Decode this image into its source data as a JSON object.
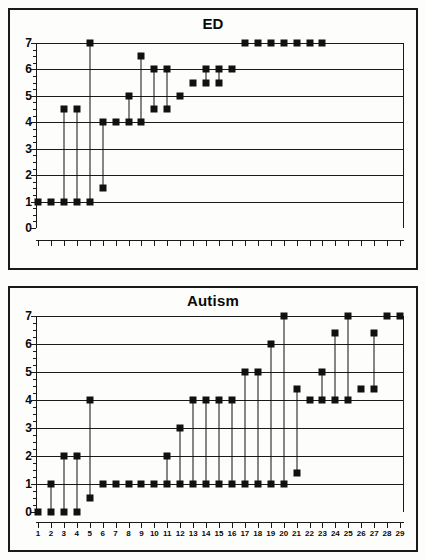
{
  "figure": {
    "panels": [
      {
        "id": "ed",
        "title": "ED"
      },
      {
        "id": "autism",
        "title": "Autism"
      }
    ],
    "marker_color": "#111111",
    "axis_color": "#1a1a1a",
    "background": "#fdfdfc"
  },
  "axis": {
    "y_ticks": [
      "0",
      "1",
      "2",
      "3",
      "4",
      "5",
      "6",
      "7"
    ],
    "x_ticks": [
      "1",
      "2",
      "3",
      "4",
      "5",
      "6",
      "7",
      "8",
      "9",
      "10",
      "11",
      "12",
      "13",
      "14",
      "15",
      "16",
      "17",
      "18",
      "19",
      "20",
      "21",
      "22",
      "23",
      "24",
      "25",
      "26",
      "27",
      "28",
      "29"
    ]
  },
  "chart_data": [
    {
      "type": "scatter",
      "title": "ED",
      "xlabel": "",
      "ylabel": "",
      "ylim": [
        0,
        7
      ],
      "xlim": [
        1,
        29
      ],
      "grid": true,
      "legend": "none",
      "x_tick_labels_shown": false,
      "categories": [
        1,
        2,
        3,
        4,
        5,
        6,
        7,
        8,
        9,
        10,
        11,
        12,
        13,
        14,
        15,
        16,
        17,
        18,
        19,
        20,
        21,
        22,
        23,
        24,
        25,
        26,
        27,
        28,
        29
      ],
      "series": [
        {
          "name": "pre",
          "values": [
            1,
            1,
            1,
            1,
            1,
            4,
            4,
            4,
            5,
            4,
            6,
            6,
            4.5,
            4.5,
            5.5,
            5.5,
            5.5,
            6,
            7,
            7,
            7,
            7,
            7,
            7,
            7,
            null,
            null,
            null,
            null
          ]
        },
        {
          "name": "post",
          "values": [
            1,
            1,
            4.5,
            4.5,
            7,
            1.5,
            null,
            6.5,
            null,
            null,
            4.5,
            4.5,
            6,
            6,
            6,
            6,
            6,
            null,
            null,
            null,
            null,
            null,
            null,
            null,
            null,
            null,
            null,
            null,
            null
          ]
        }
      ],
      "points": [
        {
          "x": 1,
          "y": [
            1
          ]
        },
        {
          "x": 2,
          "y": [
            1
          ]
        },
        {
          "x": 3,
          "y": [
            1,
            4.5
          ]
        },
        {
          "x": 4,
          "y": [
            1,
            4.5
          ]
        },
        {
          "x": 5,
          "y": [
            1,
            7
          ]
        },
        {
          "x": 6,
          "y": [
            1.5,
            4
          ]
        },
        {
          "x": 7,
          "y": [
            4
          ]
        },
        {
          "x": 8,
          "y": [
            4,
            5
          ]
        },
        {
          "x": 9,
          "y": [
            4,
            6.5
          ]
        },
        {
          "x": 10,
          "y": [
            4.5,
            6
          ]
        },
        {
          "x": 11,
          "y": [
            4.5,
            6
          ]
        },
        {
          "x": 12,
          "y": [
            5
          ]
        },
        {
          "x": 13,
          "y": [
            5.5
          ]
        },
        {
          "x": 14,
          "y": [
            5.5,
            6
          ]
        },
        {
          "x": 15,
          "y": [
            5.5,
            6
          ]
        },
        {
          "x": 16,
          "y": [
            6
          ]
        },
        {
          "x": 17,
          "y": [
            7
          ]
        },
        {
          "x": 18,
          "y": [
            7
          ]
        },
        {
          "x": 19,
          "y": [
            7
          ]
        },
        {
          "x": 20,
          "y": [
            7
          ]
        },
        {
          "x": 21,
          "y": [
            7
          ]
        },
        {
          "x": 22,
          "y": [
            7
          ]
        },
        {
          "x": 23,
          "y": [
            7
          ]
        }
      ]
    },
    {
      "type": "scatter",
      "title": "Autism",
      "xlabel": "",
      "ylabel": "",
      "ylim": [
        0,
        7
      ],
      "xlim": [
        1,
        29
      ],
      "grid": true,
      "legend": "none",
      "x_tick_labels_shown": true,
      "categories": [
        1,
        2,
        3,
        4,
        5,
        6,
        7,
        8,
        9,
        10,
        11,
        12,
        13,
        14,
        15,
        16,
        17,
        18,
        19,
        20,
        21,
        22,
        23,
        24,
        25,
        26,
        27,
        28,
        29
      ],
      "series": [
        {
          "name": "pre",
          "values": [
            0,
            0,
            0,
            0,
            0.5,
            1,
            1,
            1,
            1,
            1,
            1,
            1,
            1,
            1,
            1,
            1,
            1,
            1,
            1,
            1,
            1.4,
            4,
            4,
            4,
            4,
            4.4,
            4.4,
            7,
            7
          ]
        },
        {
          "name": "post",
          "values": [
            0,
            1,
            2,
            2,
            4,
            1,
            1,
            1,
            1,
            1,
            2,
            3,
            4,
            4,
            4,
            4,
            5,
            5,
            6,
            7,
            4.4,
            4,
            5,
            6.4,
            7,
            4.4,
            6.4,
            7,
            7
          ]
        }
      ],
      "points": [
        {
          "x": 1,
          "y": [
            0
          ]
        },
        {
          "x": 2,
          "y": [
            0,
            1
          ]
        },
        {
          "x": 3,
          "y": [
            0,
            2
          ]
        },
        {
          "x": 4,
          "y": [
            0,
            2
          ]
        },
        {
          "x": 5,
          "y": [
            0.5,
            4
          ]
        },
        {
          "x": 6,
          "y": [
            1
          ]
        },
        {
          "x": 7,
          "y": [
            1
          ]
        },
        {
          "x": 8,
          "y": [
            1
          ]
        },
        {
          "x": 9,
          "y": [
            1
          ]
        },
        {
          "x": 10,
          "y": [
            1
          ]
        },
        {
          "x": 11,
          "y": [
            1,
            2
          ]
        },
        {
          "x": 12,
          "y": [
            1,
            3
          ]
        },
        {
          "x": 13,
          "y": [
            1,
            4
          ]
        },
        {
          "x": 14,
          "y": [
            1,
            4
          ]
        },
        {
          "x": 15,
          "y": [
            1,
            4
          ]
        },
        {
          "x": 16,
          "y": [
            1,
            4
          ]
        },
        {
          "x": 17,
          "y": [
            1,
            5
          ]
        },
        {
          "x": 18,
          "y": [
            1,
            5
          ]
        },
        {
          "x": 19,
          "y": [
            1,
            6
          ]
        },
        {
          "x": 20,
          "y": [
            1,
            7
          ]
        },
        {
          "x": 21,
          "y": [
            1.4,
            4.4
          ]
        },
        {
          "x": 22,
          "y": [
            4
          ]
        },
        {
          "x": 23,
          "y": [
            4,
            5
          ]
        },
        {
          "x": 24,
          "y": [
            4,
            6.4
          ]
        },
        {
          "x": 25,
          "y": [
            4,
            7
          ]
        },
        {
          "x": 26,
          "y": [
            4.4
          ]
        },
        {
          "x": 27,
          "y": [
            4.4,
            6.4
          ]
        },
        {
          "x": 28,
          "y": [
            7
          ]
        },
        {
          "x": 29,
          "y": [
            7
          ]
        }
      ]
    }
  ]
}
